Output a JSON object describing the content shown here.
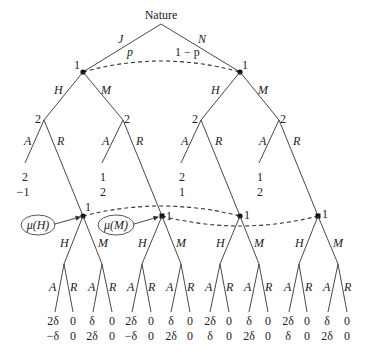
{
  "root": {
    "label": "Nature"
  },
  "nature_moves": [
    {
      "action": "J",
      "prob": "p"
    },
    {
      "action": "N",
      "prob": "1 − p"
    }
  ],
  "player_labels": {
    "p1": "1",
    "p2": "2"
  },
  "actions": {
    "H": "H",
    "M": "M",
    "A": "A",
    "R": "R"
  },
  "top_leaves": [
    {
      "p1": "2",
      "p2": "−1"
    },
    {
      "p1": "1",
      "p2": "2"
    },
    {
      "p1": "2",
      "p2": "1"
    },
    {
      "p1": "1",
      "p2": "2"
    }
  ],
  "beliefs": {
    "mu_H": "μ(H)",
    "mu_M": "μ(M)"
  },
  "bottom_leaves": [
    {
      "p1": "2δ",
      "p2": "−δ"
    },
    {
      "p1": "0",
      "p2": "0"
    },
    {
      "p1": "δ",
      "p2": "2δ"
    },
    {
      "p1": "0",
      "p2": "0"
    },
    {
      "p1": "2δ",
      "p2": "−δ"
    },
    {
      "p1": "0",
      "p2": "0"
    },
    {
      "p1": "δ",
      "p2": "2δ"
    },
    {
      "p1": "0",
      "p2": "0"
    },
    {
      "p1": "2δ",
      "p2": "δ"
    },
    {
      "p1": "0",
      "p2": "0"
    },
    {
      "p1": "δ",
      "p2": "2δ"
    },
    {
      "p1": "0",
      "p2": "0"
    },
    {
      "p1": "2δ",
      "p2": "δ"
    },
    {
      "p1": "0",
      "p2": "0"
    },
    {
      "p1": "δ",
      "p2": "2δ"
    },
    {
      "p1": "0",
      "p2": "0"
    }
  ]
}
